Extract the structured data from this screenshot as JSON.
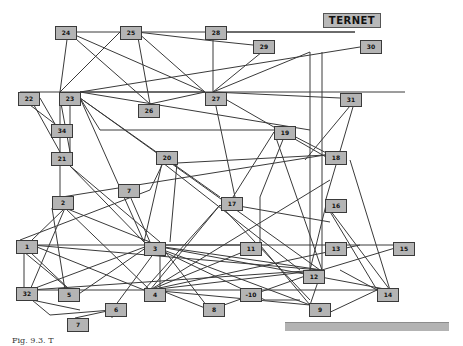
{
  "diagram": {
    "title": "TERNET",
    "caption": "Fig. 9.3. T",
    "colors": {
      "node_fill": "#b4b4b4",
      "node_border": "#3a3a3a",
      "edge": "#3a3a3a",
      "bar": "#b3b3b3"
    },
    "nodes": [
      {
        "id": "24",
        "label": "24",
        "x": 55,
        "y": 26
      },
      {
        "id": "25",
        "label": "25",
        "x": 120,
        "y": 26
      },
      {
        "id": "28",
        "label": "28",
        "x": 205,
        "y": 26
      },
      {
        "id": "29",
        "label": "29",
        "x": 253,
        "y": 40
      },
      {
        "id": "30",
        "label": "30",
        "x": 360,
        "y": 40
      },
      {
        "id": "22",
        "label": "22",
        "x": 18,
        "y": 92
      },
      {
        "id": "23",
        "label": "23",
        "x": 59,
        "y": 92
      },
      {
        "id": "26",
        "label": "26",
        "x": 138,
        "y": 104
      },
      {
        "id": "27",
        "label": "27",
        "x": 205,
        "y": 92
      },
      {
        "id": "31",
        "label": "31",
        "x": 340,
        "y": 93
      },
      {
        "id": "34",
        "label": "34",
        "x": 51,
        "y": 124
      },
      {
        "id": "19",
        "label": "19",
        "x": 274,
        "y": 126
      },
      {
        "id": "21",
        "label": "21",
        "x": 51,
        "y": 152
      },
      {
        "id": "20",
        "label": "20",
        "x": 156,
        "y": 151
      },
      {
        "id": "18",
        "label": "18",
        "x": 325,
        "y": 151
      },
      {
        "id": "2",
        "label": "2",
        "x": 52,
        "y": 196
      },
      {
        "id": "7a",
        "label": "7",
        "x": 118,
        "y": 184
      },
      {
        "id": "17",
        "label": "17",
        "x": 221,
        "y": 197
      },
      {
        "id": "16",
        "label": "16",
        "x": 325,
        "y": 199
      },
      {
        "id": "1",
        "label": "1",
        "x": 16,
        "y": 240
      },
      {
        "id": "3",
        "label": "3",
        "x": 144,
        "y": 242
      },
      {
        "id": "11",
        "label": "11",
        "x": 240,
        "y": 242
      },
      {
        "id": "13",
        "label": "13",
        "x": 325,
        "y": 242
      },
      {
        "id": "15",
        "label": "15",
        "x": 393,
        "y": 242
      },
      {
        "id": "12",
        "label": "12",
        "x": 303,
        "y": 270
      },
      {
        "id": "32",
        "label": "32",
        "x": 16,
        "y": 287
      },
      {
        "id": "5",
        "label": "5",
        "x": 58,
        "y": 288
      },
      {
        "id": "4",
        "label": "4",
        "x": 144,
        "y": 288
      },
      {
        "id": "10",
        "label": "-10",
        "x": 240,
        "y": 288
      },
      {
        "id": "14",
        "label": "14",
        "x": 377,
        "y": 288
      },
      {
        "id": "6",
        "label": "6",
        "x": 105,
        "y": 303
      },
      {
        "id": "8",
        "label": "8",
        "x": 203,
        "y": 303
      },
      {
        "id": "9",
        "label": "9",
        "x": 309,
        "y": 303
      },
      {
        "id": "7b",
        "label": "7",
        "x": 67,
        "y": 318
      }
    ],
    "edges": [
      [
        68,
        32,
        355,
        32
      ],
      [
        68,
        32,
        60,
        92
      ],
      [
        68,
        32,
        150,
        104
      ],
      [
        68,
        32,
        205,
        92
      ],
      [
        120,
        32,
        60,
        92
      ],
      [
        137,
        32,
        150,
        104
      ],
      [
        137,
        32,
        205,
        92
      ],
      [
        137,
        32,
        205,
        40
      ],
      [
        205,
        40,
        253,
        45
      ],
      [
        213,
        32,
        213,
        92
      ],
      [
        213,
        32,
        355,
        32
      ],
      [
        262,
        52,
        213,
        92
      ],
      [
        360,
        47,
        80,
        92
      ],
      [
        20,
        92,
        405,
        92
      ],
      [
        80,
        92,
        205,
        92
      ],
      [
        80,
        92,
        310,
        130
      ],
      [
        150,
        104,
        205,
        92
      ],
      [
        213,
        92,
        340,
        98
      ],
      [
        213,
        92,
        326,
        157
      ],
      [
        213,
        92,
        310,
        52
      ],
      [
        310,
        52,
        310,
        270
      ],
      [
        213,
        92,
        235,
        197
      ],
      [
        30,
        98,
        60,
        152
      ],
      [
        30,
        105,
        55,
        124
      ],
      [
        40,
        98,
        55,
        124
      ],
      [
        60,
        98,
        60,
        152
      ],
      [
        60,
        98,
        70,
        152
      ],
      [
        70,
        152,
        70,
        98
      ],
      [
        80,
        98,
        144,
        242
      ],
      [
        80,
        98,
        100,
        130
      ],
      [
        100,
        130,
        274,
        130
      ],
      [
        80,
        98,
        220,
        197
      ],
      [
        80,
        98,
        320,
        270
      ],
      [
        274,
        132,
        233,
        197
      ],
      [
        274,
        132,
        322,
        270
      ],
      [
        286,
        132,
        340,
        160
      ],
      [
        286,
        132,
        260,
        197
      ],
      [
        355,
        100,
        305,
        160
      ],
      [
        355,
        100,
        326,
        199
      ],
      [
        60,
        166,
        60,
        197
      ],
      [
        70,
        166,
        144,
        242
      ],
      [
        70,
        166,
        160,
        242
      ],
      [
        62,
        197,
        325,
        155
      ],
      [
        162,
        163,
        144,
        242
      ],
      [
        163,
        163,
        300,
        270
      ],
      [
        163,
        163,
        150,
        190
      ],
      [
        150,
        190,
        20,
        240
      ],
      [
        177,
        163,
        170,
        242
      ],
      [
        177,
        163,
        326,
        155
      ],
      [
        130,
        196,
        150,
        242
      ],
      [
        220,
        205,
        144,
        290
      ],
      [
        233,
        205,
        330,
        222
      ],
      [
        220,
        205,
        310,
        300
      ],
      [
        326,
        205,
        310,
        270
      ],
      [
        326,
        205,
        377,
        290
      ],
      [
        65,
        208,
        32,
        240
      ],
      [
        65,
        208,
        30,
        290
      ],
      [
        52,
        208,
        65,
        290
      ],
      [
        65,
        208,
        150,
        242
      ],
      [
        65,
        208,
        150,
        290
      ],
      [
        32,
        245,
        150,
        245
      ],
      [
        32,
        245,
        144,
        290
      ],
      [
        32,
        245,
        320,
        270
      ],
      [
        24,
        252,
        24,
        290
      ],
      [
        24,
        252,
        70,
        290
      ],
      [
        30,
        290,
        150,
        245
      ],
      [
        30,
        290,
        320,
        270
      ],
      [
        32,
        290,
        150,
        290
      ],
      [
        32,
        300,
        80,
        310
      ],
      [
        32,
        300,
        50,
        315
      ],
      [
        50,
        315,
        112,
        310
      ],
      [
        70,
        300,
        150,
        245
      ],
      [
        70,
        290,
        30,
        252
      ],
      [
        150,
        245,
        240,
        245
      ],
      [
        150,
        245,
        322,
        270
      ],
      [
        150,
        245,
        310,
        305
      ],
      [
        150,
        245,
        390,
        290
      ],
      [
        150,
        245,
        405,
        245
      ],
      [
        160,
        245,
        160,
        290
      ],
      [
        160,
        245,
        210,
        310
      ],
      [
        160,
        245,
        112,
        310
      ],
      [
        150,
        290,
        220,
        205
      ],
      [
        150,
        290,
        260,
        245
      ],
      [
        150,
        290,
        322,
        270
      ],
      [
        150,
        290,
        310,
        305
      ],
      [
        150,
        290,
        377,
        290
      ],
      [
        150,
        290,
        360,
        245
      ],
      [
        150,
        290,
        330,
        180
      ],
      [
        160,
        290,
        210,
        310
      ],
      [
        210,
        310,
        322,
        270
      ],
      [
        150,
        245,
        265,
        300
      ],
      [
        265,
        300,
        300,
        300
      ],
      [
        260,
        245,
        310,
        305
      ],
      [
        260,
        245,
        260,
        197
      ],
      [
        322,
        270,
        405,
        245
      ],
      [
        322,
        270,
        310,
        305
      ],
      [
        322,
        270,
        322,
        52
      ],
      [
        340,
        270,
        377,
        290
      ],
      [
        390,
        290,
        330,
        210
      ],
      [
        390,
        290,
        350,
        160
      ],
      [
        322,
        316,
        377,
        290
      ],
      [
        112,
        310,
        112,
        318
      ],
      [
        75,
        318,
        112,
        310
      ]
    ]
  }
}
